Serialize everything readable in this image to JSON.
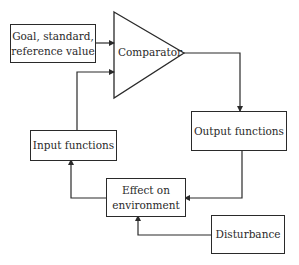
{
  "diagram": {
    "type": "feedback control loop",
    "nodes": {
      "goal": {
        "label": "Goal, standard,\nreference value"
      },
      "comparator": {
        "label": "Comparator",
        "shape": "triangle"
      },
      "output": {
        "label": "Output functions"
      },
      "input": {
        "label": "Input functions"
      },
      "effect": {
        "label": "Effect on\nenvironment"
      },
      "disturbance": {
        "label": "Disturbance"
      }
    },
    "edges": [
      {
        "from": "goal",
        "to": "comparator"
      },
      {
        "from": "input",
        "to": "comparator"
      },
      {
        "from": "comparator",
        "to": "output"
      },
      {
        "from": "output",
        "to": "effect"
      },
      {
        "from": "effect",
        "to": "input"
      },
      {
        "from": "disturbance",
        "to": "effect"
      }
    ],
    "colors": {
      "line": "#2a2a2a",
      "background": "#ffffff"
    }
  }
}
